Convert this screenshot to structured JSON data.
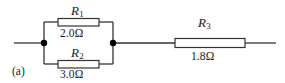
{
  "figure": {
    "caption": "(a)",
    "type": "circuit-diagram",
    "colors": {
      "wire": "#333333",
      "resistor_outline": "#333333",
      "resistor_fill": "#ffffff",
      "node": "#000000",
      "text": "#1a1a1a",
      "background": "#ffffff"
    }
  },
  "components": {
    "r1": {
      "symbol": "R",
      "subscript": "1",
      "value": "2.0Ω",
      "position": "parallel-top"
    },
    "r2": {
      "symbol": "R",
      "subscript": "2",
      "value": "3.0Ω",
      "position": "parallel-bottom"
    },
    "r3": {
      "symbol": "R",
      "subscript": "3",
      "value": "1.8Ω",
      "position": "series-right"
    }
  },
  "nodes": {
    "left": {
      "x": 44,
      "y": 43
    },
    "right": {
      "x": 113,
      "y": 43
    }
  }
}
